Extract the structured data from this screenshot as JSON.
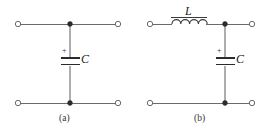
{
  "figure": {
    "background_color": "#ffffff",
    "wire_color": "#6b6b6b",
    "symbol_color": "#2b2b2b",
    "text_color": "#222222",
    "panels": [
      {
        "id": "a",
        "caption": "(a)",
        "components": [
          {
            "type": "capacitor",
            "label": "C",
            "polarity_sign": "+",
            "orientation": "vertical",
            "position": "shunt"
          }
        ],
        "terminals": [
          {
            "name": "top-left",
            "style": "open-circle"
          },
          {
            "name": "top-right",
            "style": "open-circle"
          },
          {
            "name": "bottom-left",
            "style": "open-circle"
          },
          {
            "name": "bottom-right",
            "style": "open-circle"
          }
        ],
        "nodes": [
          {
            "name": "top-junction",
            "style": "filled-dot"
          },
          {
            "name": "bottom-junction",
            "style": "filled-dot"
          }
        ]
      },
      {
        "id": "b",
        "caption": "(b)",
        "components": [
          {
            "type": "inductor",
            "label": "L",
            "orientation": "horizontal",
            "position": "series",
            "coil_loops": 4
          },
          {
            "type": "capacitor",
            "label": "C",
            "polarity_sign": "+",
            "orientation": "vertical",
            "position": "shunt"
          }
        ],
        "terminals": [
          {
            "name": "top-left",
            "style": "open-circle"
          },
          {
            "name": "top-right",
            "style": "open-circle"
          },
          {
            "name": "bottom-left",
            "style": "open-circle"
          },
          {
            "name": "bottom-right",
            "style": "open-circle"
          }
        ],
        "nodes": [
          {
            "name": "top-junction",
            "style": "filled-dot"
          },
          {
            "name": "bottom-junction",
            "style": "filled-dot"
          }
        ]
      }
    ]
  }
}
